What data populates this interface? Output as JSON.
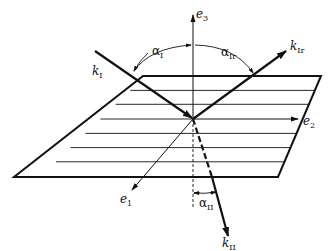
{
  "diagram": {
    "type": "vector reflection/refraction at plane interface",
    "colors": {
      "ink": "#111111",
      "background": "#ffffff"
    },
    "axes": {
      "e1": {
        "label": "e",
        "sub": "1"
      },
      "e2": {
        "label": "e",
        "sub": "2"
      },
      "e3": {
        "label": "e",
        "sub": "3"
      }
    },
    "vectors": {
      "k_incident": {
        "label": "k",
        "sub": "I"
      },
      "k_reflected": {
        "label": "k",
        "sub": "Ir"
      },
      "k_transmitted": {
        "label": "k",
        "sub": "II"
      }
    },
    "angles": {
      "alpha_incident": {
        "label": "α",
        "sub": "I"
      },
      "alpha_reflected": {
        "label": "α",
        "sub": "Ir"
      },
      "alpha_transmitted": {
        "label": "α",
        "sub": "II"
      }
    },
    "plane": {
      "hatch_lines": 8
    }
  }
}
